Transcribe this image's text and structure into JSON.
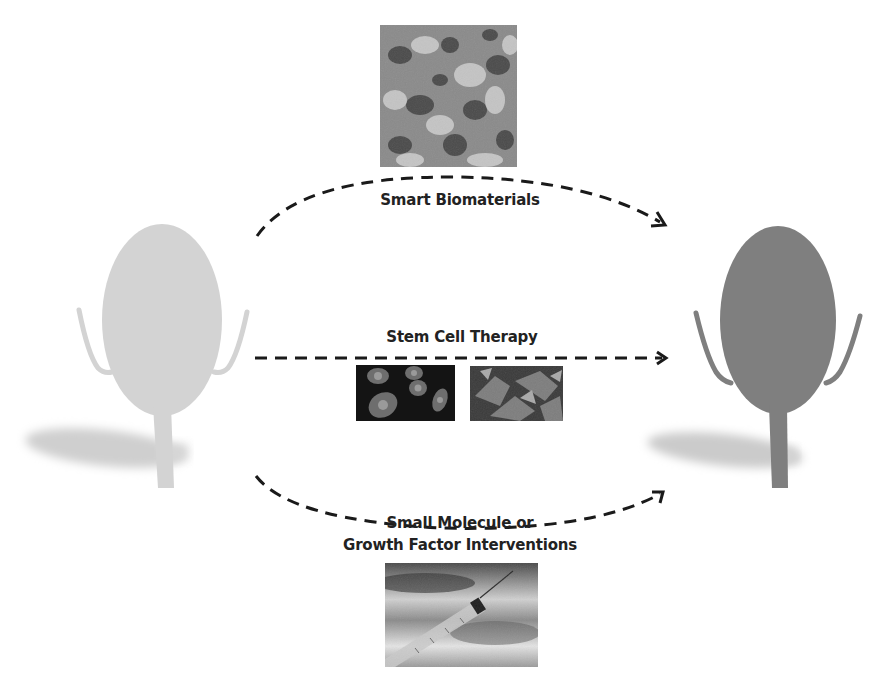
{
  "diagram": {
    "colors": {
      "diseased_organ": "#d3d3d3",
      "healthy_organ": "#7f7f7f",
      "shadow": "#c8c8c8",
      "arrow": "#1a1a1a",
      "text": "#222222"
    },
    "source_organ": {
      "label": "diseased-organ",
      "state": "pale"
    },
    "target_organ": {
      "label": "regenerated-organ",
      "state": "healthy"
    },
    "pathways": [
      {
        "id": "biomaterials",
        "label": "Smart Biomaterials",
        "arrow_style": "dashed-arc-up",
        "image": "scanning-electron-micrograph"
      },
      {
        "id": "stemcell",
        "label": "Stem Cell Therapy",
        "arrow_style": "dashed-straight",
        "images": [
          "fluorescent-stem-cells",
          "stained-tissue-cells"
        ]
      },
      {
        "id": "smallmol",
        "label_line1": "Small Molecule or",
        "label_line2": "Growth Factor Interventions",
        "arrow_style": "dashed-arc-down",
        "image": "syringe"
      }
    ]
  }
}
